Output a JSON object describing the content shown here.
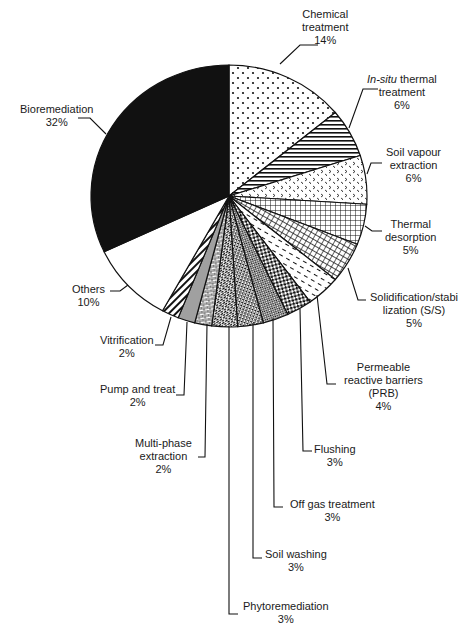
{
  "chart_data": {
    "type": "pie",
    "title": "",
    "start_angle_deg": 0,
    "direction": "clockwise",
    "slices": [
      {
        "label": "Chemical treatment",
        "value": 14,
        "pattern": "dots"
      },
      {
        "label": "In-situ thermal treatment",
        "value": 6,
        "pattern": "horizontal-lines"
      },
      {
        "label": "Soil vapour extraction",
        "value": 6,
        "pattern": "chevrons"
      },
      {
        "label": "Thermal desorption",
        "value": 5,
        "pattern": "grid"
      },
      {
        "label": "Solidification/stabilization (S/S)",
        "value": 5,
        "pattern": "diagonal-crosshatch"
      },
      {
        "label": "Permeable reactive barriers (PRB)",
        "value": 4,
        "pattern": "dashes"
      },
      {
        "label": "Flushing",
        "value": 3,
        "pattern": "checkerboard"
      },
      {
        "label": "Off gas treatment",
        "value": 3,
        "pattern": "fine-checker"
      },
      {
        "label": "Soil washing",
        "value": 3,
        "pattern": "dense-weave"
      },
      {
        "label": "Phytoremediation",
        "value": 3,
        "pattern": "diagonal-weave"
      },
      {
        "label": "Multi-phase extraction",
        "value": 2,
        "pattern": "bricks"
      },
      {
        "label": "Pump and treat",
        "value": 2,
        "pattern": "solid-grey"
      },
      {
        "label": "Vitrification",
        "value": 2,
        "pattern": "diagonal-stripes"
      },
      {
        "label": "Others",
        "value": 10,
        "pattern": "white"
      },
      {
        "label": "Bioremediation",
        "value": 32,
        "pattern": "solid-black"
      }
    ],
    "legend": "none (leader-line labels)"
  },
  "labels": {
    "chemical": {
      "line1": "Chemical",
      "line2": "treatment",
      "pct": "14%"
    },
    "insitu": {
      "italic": "In-situ",
      "line1rest": " thermal",
      "line2": "treatment",
      "pct": "6%"
    },
    "vapour": {
      "line1": "Soil vapour",
      "line2": "extraction",
      "pct": "6%"
    },
    "thermal": {
      "line1": "Thermal",
      "line2": "desorption",
      "pct": "5%"
    },
    "ss": {
      "line1": "Solidification/stabi",
      "line2": "lization (S/S)",
      "pct": "5%"
    },
    "prb": {
      "line1": "Permeable",
      "line2": "reactive barriers",
      "line3": "(PRB)",
      "pct": "4%"
    },
    "flushing": {
      "line1": "Flushing",
      "pct": "3%"
    },
    "offgas": {
      "line1": "Off gas treatment",
      "pct": "3%"
    },
    "washing": {
      "line1": "Soil washing",
      "pct": "3%"
    },
    "phyto": {
      "line1": "Phytoremediation",
      "pct": "3%"
    },
    "multiphase": {
      "line1": "Multi-phase",
      "line2": "extraction",
      "pct": "2%"
    },
    "pump": {
      "line1": "Pump and treat",
      "pct": "2%"
    },
    "vitrification": {
      "line1": "Vitrification",
      "pct": "2%"
    },
    "others": {
      "line1": "Others",
      "pct": "10%"
    },
    "bio": {
      "line1": "Bioremediation",
      "pct": "32%"
    }
  },
  "colors": {
    "ink": "#111111",
    "grey": "#a0a0a0",
    "background": "#ffffff"
  }
}
